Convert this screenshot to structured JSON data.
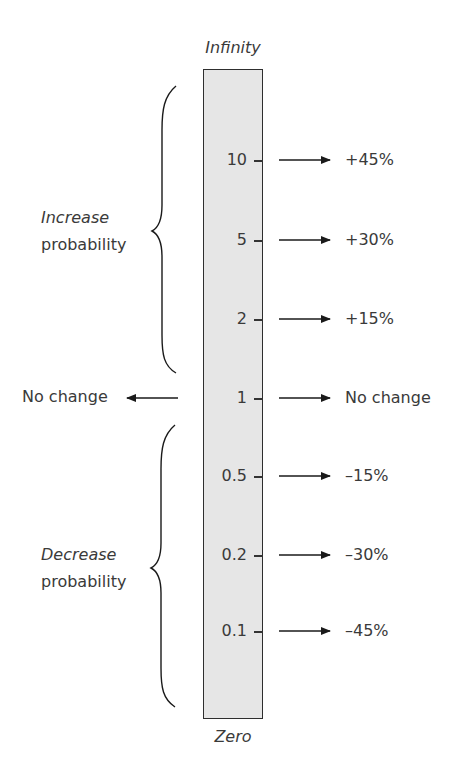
{
  "diagram": {
    "top_label": "Infinity",
    "bottom_label": "Zero",
    "rows": [
      {
        "ratio": "10",
        "change": "+45%"
      },
      {
        "ratio": "5",
        "change": "+30%"
      },
      {
        "ratio": "2",
        "change": "+15%"
      },
      {
        "ratio": "1",
        "change": "No change"
      },
      {
        "ratio": "0.5",
        "change": "–15%"
      },
      {
        "ratio": "0.2",
        "change": "–30%"
      },
      {
        "ratio": "0.1",
        "change": "–45%"
      }
    ],
    "increase_group": {
      "emphasis": "Increase",
      "text": "probability"
    },
    "decrease_group": {
      "emphasis": "Decrease",
      "text": "probability"
    },
    "no_change_left": "No change",
    "colors": {
      "bar_fill": "#e6e6e6",
      "bar_border": "#2e2e2e",
      "text": "#3a3a3a",
      "arrow": "#1a1a1a"
    }
  }
}
